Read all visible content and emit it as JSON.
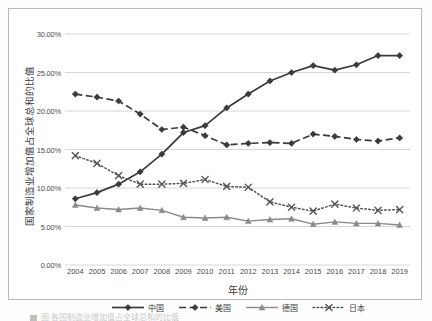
{
  "chart_data": {
    "type": "line",
    "title": "",
    "xlabel": "年份",
    "ylabel": "国家制造业增加值占全球总和的比值",
    "x": [
      2004,
      2005,
      2006,
      2007,
      2008,
      2009,
      2010,
      2011,
      2012,
      2013,
      2014,
      2015,
      2016,
      2017,
      2018,
      2019
    ],
    "categories": [
      "2004",
      "2005",
      "2006",
      "2007",
      "2008",
      "2009",
      "2010",
      "2011",
      "2012",
      "2013",
      "2014",
      "2015",
      "2016",
      "2017",
      "2018",
      "2019"
    ],
    "ylim": [
      0,
      30
    ],
    "ytick_labels": [
      "0.00%",
      "5.00%",
      "10.00%",
      "15.00%",
      "20.00%",
      "25.00%",
      "30.00%"
    ],
    "ytick_values": [
      0,
      5,
      10,
      15,
      20,
      25,
      30
    ],
    "grid": "horizontal",
    "legend_position": "bottom",
    "series": [
      {
        "name": "中国",
        "marker": "diamond",
        "line_style": "solid",
        "color": "#3b3b3b",
        "values": [
          8.6,
          9.4,
          10.5,
          12.1,
          14.4,
          17.2,
          18.1,
          20.4,
          22.2,
          23.9,
          25.0,
          25.9,
          25.3,
          26.0,
          27.2,
          27.2
        ]
      },
      {
        "name": "美国",
        "marker": "diamond",
        "line_style": "dashed",
        "color": "#3b3b3b",
        "values": [
          22.2,
          21.8,
          21.3,
          19.6,
          17.6,
          17.9,
          16.8,
          15.6,
          15.8,
          15.9,
          15.8,
          17.0,
          16.7,
          16.3,
          16.1,
          16.5
        ]
      },
      {
        "name": "德国",
        "marker": "triangle",
        "line_style": "solid-light",
        "color": "#8a8a8a",
        "values": [
          7.8,
          7.4,
          7.2,
          7.4,
          7.1,
          6.2,
          6.1,
          6.2,
          5.7,
          5.9,
          6.0,
          5.3,
          5.6,
          5.4,
          5.4,
          5.2
        ]
      },
      {
        "name": "日本",
        "marker": "x",
        "line_style": "dotted",
        "color": "#555555",
        "values": [
          14.2,
          13.2,
          11.6,
          10.5,
          10.5,
          10.6,
          11.1,
          10.2,
          10.1,
          8.2,
          7.5,
          7.0,
          7.9,
          7.4,
          7.1,
          7.2
        ]
      }
    ]
  },
  "axis": {
    "y_title": "国家制造业增加值占全球总和的比值",
    "x_title": "年份",
    "y_ticks": [
      "30.00%",
      "25.00%",
      "20.00%",
      "15.00%",
      "10.00%",
      "5.00%",
      "0.00%"
    ],
    "x_ticks": [
      "2004",
      "2005",
      "2006",
      "2007",
      "2008",
      "2009",
      "2010",
      "2011",
      "2012",
      "2013",
      "2014",
      "2015",
      "2016",
      "2017",
      "2018",
      "2019"
    ]
  },
  "legend": {
    "items": [
      {
        "label": "中国",
        "icon": "diamond-solid-line-icon"
      },
      {
        "label": "美国",
        "icon": "diamond-dashed-line-icon"
      },
      {
        "label": "德国",
        "icon": "triangle-line-icon"
      },
      {
        "label": "日本",
        "icon": "x-dotted-line-icon"
      }
    ]
  },
  "caption": {
    "text": "图 各国制造业增加值占全球总和的比值"
  },
  "colors": {
    "china": "#3b3b3b",
    "usa": "#3b3b3b",
    "germany": "#8a8a8a",
    "japan": "#555555",
    "grid": "#d6d6d6",
    "frame": "#b9b9b9"
  }
}
